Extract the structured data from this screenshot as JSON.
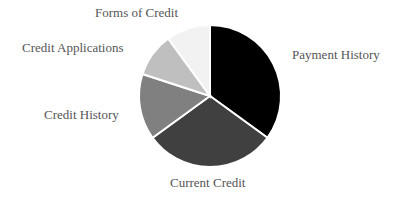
{
  "chart_data": {
    "type": "pie",
    "title": "",
    "categories": [
      "Payment History",
      "Current Credit",
      "Credit History",
      "Credit Applications",
      "Forms of Credit"
    ],
    "values": [
      35,
      30,
      15,
      10,
      10
    ],
    "colors": [
      "#000000",
      "#404040",
      "#808080",
      "#bfbfbf",
      "#f2f2f2"
    ],
    "start_angle_deg": 0,
    "direction": "clockwise",
    "legend": "none (data labels outside slices)"
  },
  "labels": {
    "payment_history": "Payment History",
    "current_credit": "Current Credit",
    "credit_history": "Credit History",
    "credit_applications": "Credit Applications",
    "forms_of_credit": "Forms of Credit"
  }
}
